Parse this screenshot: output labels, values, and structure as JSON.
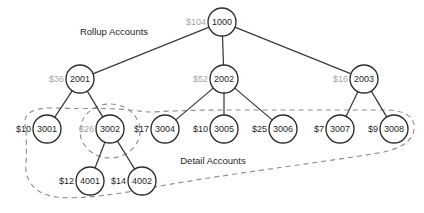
{
  "diagram": {
    "captions": [
      {
        "name": "rollup-accounts",
        "text": "Rollup Accounts",
        "x": 114,
        "y": 32
      },
      {
        "name": "detail-accounts",
        "text": "Detail Accounts",
        "x": 213,
        "y": 161
      }
    ],
    "nodes": [
      {
        "id": "1000",
        "label": "1000",
        "amount": "$104",
        "amount_muted": true,
        "cx": 222,
        "cy": 22,
        "r": 14
      },
      {
        "id": "2001",
        "label": "2001",
        "amount": "$36",
        "amount_muted": true,
        "cx": 80,
        "cy": 79,
        "r": 14
      },
      {
        "id": "2002",
        "label": "2002",
        "amount": "$52",
        "amount_muted": true,
        "cx": 224,
        "cy": 79,
        "r": 14
      },
      {
        "id": "2003",
        "label": "2003",
        "amount": "$16",
        "amount_muted": true,
        "cx": 364,
        "cy": 79,
        "r": 14
      },
      {
        "id": "3001",
        "label": "3001",
        "amount": "$10",
        "amount_muted": false,
        "cx": 47,
        "cy": 129,
        "r": 14
      },
      {
        "id": "3002",
        "label": "3002",
        "amount": "$26",
        "amount_muted": true,
        "cx": 110,
        "cy": 129,
        "r": 14
      },
      {
        "id": "3004",
        "label": "3004",
        "amount": "$17",
        "amount_muted": false,
        "cx": 165,
        "cy": 129,
        "r": 14
      },
      {
        "id": "3005",
        "label": "3005",
        "amount": "$10",
        "amount_muted": false,
        "cx": 224,
        "cy": 129,
        "r": 14
      },
      {
        "id": "3006",
        "label": "3006",
        "amount": "$25",
        "amount_muted": false,
        "cx": 283,
        "cy": 129,
        "r": 14
      },
      {
        "id": "3007",
        "label": "3007",
        "amount": "$7",
        "amount_muted": false,
        "cx": 340,
        "cy": 129,
        "r": 14
      },
      {
        "id": "3008",
        "label": "3008",
        "amount": "$9",
        "amount_muted": false,
        "cx": 394,
        "cy": 129,
        "r": 14
      },
      {
        "id": "4001",
        "label": "4001",
        "amount": "$12",
        "amount_muted": false,
        "cx": 90,
        "cy": 181,
        "r": 14
      },
      {
        "id": "4002",
        "label": "4002",
        "amount": "$14",
        "amount_muted": false,
        "cx": 142,
        "cy": 181,
        "r": 14
      }
    ],
    "edges": [
      {
        "from": "1000",
        "to": "2001"
      },
      {
        "from": "1000",
        "to": "2002"
      },
      {
        "from": "1000",
        "to": "2003"
      },
      {
        "from": "2001",
        "to": "3001"
      },
      {
        "from": "2001",
        "to": "3002"
      },
      {
        "from": "2002",
        "to": "3004"
      },
      {
        "from": "2002",
        "to": "3005"
      },
      {
        "from": "2002",
        "to": "3006"
      },
      {
        "from": "2003",
        "to": "3007"
      },
      {
        "from": "2003",
        "to": "3008"
      },
      {
        "from": "3002",
        "to": "4001"
      },
      {
        "from": "3002",
        "to": "4002"
      }
    ],
    "groups": [
      {
        "name": "detail-accounts-enclosure",
        "kind": "blob",
        "path": "M 26 129 C 20 112 36 107 56 108 C 78 109 96 108 118 109 C 136 110 142 112 152 112 C 168 111 196 110 232 110 C 280 110 340 110 388 110 C 408 111 416 119 414 130 C 412 142 400 148 384 152 C 340 160 240 172 160 186 C 120 194 80 200 56 197 C 34 194 24 180 26 162 C 27 148 26 138 26 129 Z"
      },
      {
        "name": "account-3002-subgroup-enclosure",
        "kind": "ellipse",
        "cx": 110,
        "cy": 131,
        "rx": 30,
        "ry": 27
      }
    ]
  }
}
